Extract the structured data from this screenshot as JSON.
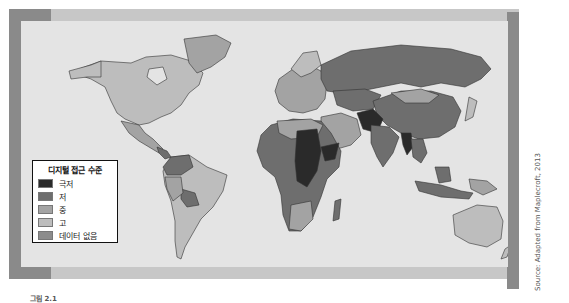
{
  "legend": {
    "title": "디지털 접근 수준",
    "items": [
      {
        "label": "극저",
        "color": "#2a2a2a"
      },
      {
        "label": "저",
        "color": "#6e6e6e"
      },
      {
        "label": "중",
        "color": "#a3a3a3"
      },
      {
        "label": "고",
        "color": "#bdbdbd"
      },
      {
        "label": "데이터 없음",
        "color": "#8c8c8c"
      }
    ]
  },
  "source": "Source: Adapted from Maplecroft, 2013",
  "caption": "그림 2.1",
  "colors": {
    "ocean": "#e4e4e4",
    "frame_light": "#c7c7c7",
    "frame_dark": "#8a8a8a",
    "very_low": "#2a2a2a",
    "low": "#6e6e6e",
    "medium": "#a3a3a3",
    "high": "#bdbdbd",
    "no_data": "#8c8c8c"
  }
}
